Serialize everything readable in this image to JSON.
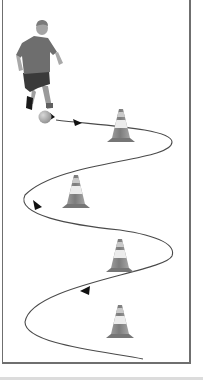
{
  "figure": {
    "colors": {
      "frame_border": "#6f6f6f",
      "path": "#444444",
      "arrow": "#111111",
      "cone_body": "#8a8a8a",
      "cone_stripe": "#e9e9e9",
      "cone_base": "#777777",
      "player_shirt": "#6e6e6e",
      "player_shorts": "#3a3a3a",
      "player_skin": "#a9a9a9",
      "ball": "#b5b5b5",
      "bottom_strip": "#dcdcdc"
    },
    "elements": {
      "player": "soccer-player",
      "ball": "soccer-ball",
      "cones": [
        "cone-1",
        "cone-2",
        "cone-3",
        "cone-4"
      ],
      "path": "slalom-dribble-path",
      "arrows": 4
    }
  }
}
